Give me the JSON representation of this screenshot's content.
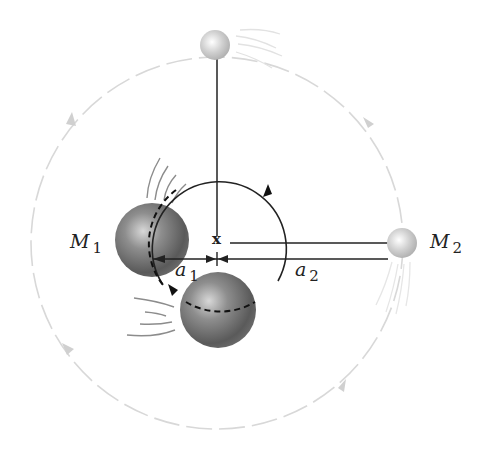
{
  "diagram": {
    "center_mark": "x",
    "labels": {
      "mass1": {
        "symbol": "M",
        "subscript": "1"
      },
      "mass2": {
        "symbol": "M",
        "subscript": "2"
      },
      "distance1": {
        "symbol": "a",
        "subscript": "1"
      },
      "distance2": {
        "symbol": "a",
        "subscript": "2"
      }
    },
    "elements": [
      {
        "name": "large-mass-M1",
        "description": "Large dark sphere shown at two positions on small orbit"
      },
      {
        "name": "small-mass-M2",
        "description": "Small light sphere shown at two positions on large orbit"
      },
      {
        "name": "small-orbit",
        "description": "Solid circle of radius a1 around center of mass with counter-clockwise arrows"
      },
      {
        "name": "large-orbit",
        "description": "Faint dashed circle of radius a2 around center of mass with counter-clockwise arrows"
      }
    ],
    "colors": {
      "line": "#222222",
      "faint_orbit": "#d6d6d6",
      "motion_lines": "#9a9a9a"
    }
  }
}
